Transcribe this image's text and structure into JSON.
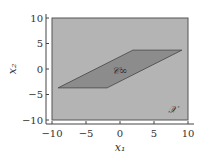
{
  "chart_data": {
    "type": "area",
    "title": "",
    "xlabel": "x₁",
    "ylabel": "x₂",
    "xlim": [
      -10,
      10
    ],
    "ylim": [
      -10,
      10
    ],
    "xticks": [
      -10,
      -5,
      0,
      5,
      10
    ],
    "yticks": [
      -10,
      -5,
      0,
      5,
      10
    ],
    "xtick_labels": [
      "−10",
      "−5",
      "0",
      "5",
      "10"
    ],
    "ytick_labels": [
      "−10",
      "−5",
      "0",
      "5",
      "10"
    ],
    "grid": false,
    "regions": [
      {
        "name": "X",
        "label": "𝒳",
        "shape": "rectangle",
        "vertices": [
          [
            -10,
            -10
          ],
          [
            10,
            -10
          ],
          [
            10,
            10
          ],
          [
            -10,
            10
          ]
        ],
        "fill": "#b4b4b4"
      },
      {
        "name": "C_infinity",
        "label": "𝒞∞",
        "shape": "parallelogram",
        "vertices": [
          [
            -9.1,
            -3.7
          ],
          [
            -1.9,
            -3.7
          ],
          [
            9.1,
            3.7
          ],
          [
            1.9,
            3.7
          ]
        ],
        "fill": "#8c8c8c"
      }
    ]
  }
}
